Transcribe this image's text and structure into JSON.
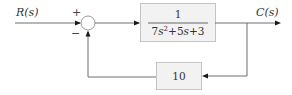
{
  "input_label": "R(s)",
  "output_label": "C(s)",
  "summing_junction": {
    "plus_sign": "+",
    "minus_sign": "−"
  },
  "forward_block": {
    "numerator": "1",
    "denominator": {
      "coef_a": "7",
      "var_a": "s",
      "exp_a": "2",
      "op1": "+",
      "coef_b": "5",
      "var_b": "s",
      "op2": "+",
      "const": "3"
    }
  },
  "feedback_block": {
    "gain": "10"
  },
  "colors": {
    "wire": "#6e6e6e",
    "block_fill": "#f2f2f2",
    "block_border": "#c4c4c4"
  }
}
